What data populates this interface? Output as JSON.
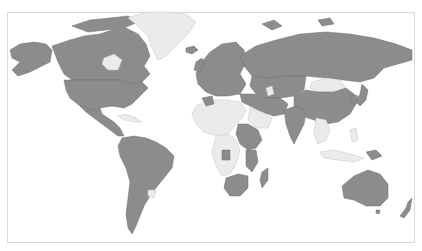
{
  "map": {
    "type": "world-choropleth",
    "projection": "natural-earth-like",
    "colors": {
      "highlighted": "#8c8c8c",
      "not_highlighted": "#ebebeb",
      "border": "#6e6e6e",
      "frame": "#d9d9d9",
      "background": "#ffffff"
    },
    "legend": null,
    "title": null,
    "regions": [
      {
        "name": "North America (Canada, USA, Alaska)",
        "state": "highlighted"
      },
      {
        "name": "Greenland",
        "state": "not_highlighted"
      },
      {
        "name": "Mexico & Central America",
        "state": "highlighted"
      },
      {
        "name": "South America",
        "state": "highlighted"
      },
      {
        "name": "Uruguay",
        "state": "not_highlighted"
      },
      {
        "name": "Europe",
        "state": "highlighted"
      },
      {
        "name": "Russia & Central Asia",
        "state": "highlighted"
      },
      {
        "name": "Mongolia",
        "state": "not_highlighted"
      },
      {
        "name": "China & East Asia",
        "state": "highlighted"
      },
      {
        "name": "Middle East",
        "state": "highlighted"
      },
      {
        "name": "Saudi Arabia",
        "state": "not_highlighted"
      },
      {
        "name": "North & West Africa",
        "state": "not_highlighted"
      },
      {
        "name": "Sudan / East Africa",
        "state": "highlighted"
      },
      {
        "name": "Central Africa",
        "state": "not_highlighted"
      },
      {
        "name": "Southern Africa",
        "state": "highlighted"
      },
      {
        "name": "Madagascar",
        "state": "highlighted"
      },
      {
        "name": "India",
        "state": "highlighted"
      },
      {
        "name": "Southeast Asia",
        "state": "not_highlighted"
      },
      {
        "name": "Australia",
        "state": "highlighted"
      },
      {
        "name": "New Zealand",
        "state": "highlighted"
      },
      {
        "name": "Japan",
        "state": "highlighted"
      }
    ]
  }
}
